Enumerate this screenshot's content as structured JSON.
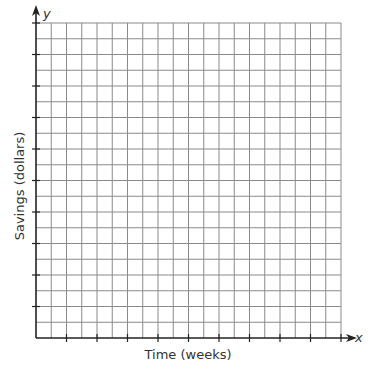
{
  "chart_data": {
    "type": "line",
    "title": "",
    "xlabel": "Time (weeks)",
    "ylabel": "Savings (dollars)",
    "x_axis_name": "x",
    "y_axis_name": "y",
    "series": [],
    "grid": true,
    "grid_columns": 20,
    "grid_rows": 20,
    "x_tick_every": 2,
    "y_tick_every": 2,
    "tick_labels": "none",
    "legend": "none",
    "colors": {
      "grid": "#8a8a8a",
      "axis": "#222222",
      "text": "#333333"
    }
  }
}
